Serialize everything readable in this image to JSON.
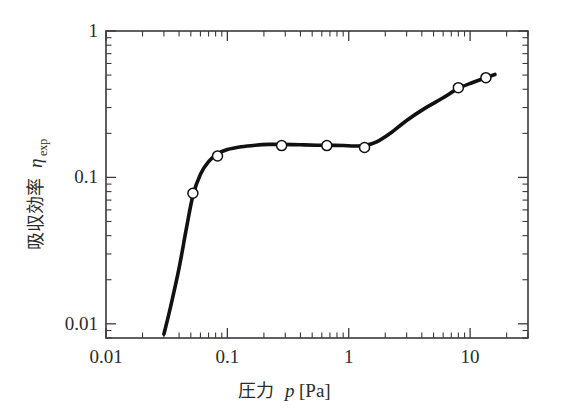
{
  "chart_data": {
    "type": "line",
    "title": "",
    "subtitle": "",
    "xlabel_jp": "圧力",
    "xlabel_sym": "p",
    "xlabel_unit": "[Pa]",
    "xlabel": "圧力 p [Pa]",
    "ylabel_jp": "吸収効率",
    "ylabel_sym": "η",
    "ylabel_subscript": "exp",
    "ylabel": "吸収効率 ηexp",
    "xscale": "log",
    "yscale": "log",
    "xlim": [
      0.01,
      30
    ],
    "ylim": [
      0.008,
      1
    ],
    "xticks": [
      0.01,
      0.1,
      1,
      10
    ],
    "xticklabels": [
      "0.01",
      "0.1",
      "1",
      "10"
    ],
    "yticks": [
      0.01,
      0.1,
      1
    ],
    "yticklabels": [
      "0.01",
      "0.1",
      "1"
    ],
    "grid": false,
    "legend": "none",
    "minor_ticks": true,
    "series": [
      {
        "name": "η_exp",
        "marker": "open-circle",
        "line": "smooth-fit",
        "x": [
          0.052,
          0.083,
          0.28,
          0.66,
          1.35,
          8.0,
          13.5
        ],
        "y": [
          0.078,
          0.14,
          0.165,
          0.165,
          0.16,
          0.41,
          0.48
        ]
      }
    ],
    "fit_curve": {
      "name": "fitted-curve",
      "x": [
        0.03,
        0.034,
        0.04,
        0.046,
        0.052,
        0.06,
        0.07,
        0.083,
        0.1,
        0.13,
        0.17,
        0.22,
        0.28,
        0.4,
        0.55,
        0.66,
        0.9,
        1.1,
        1.35,
        1.7,
        2.2,
        3.0,
        4.2,
        6.0,
        8.0,
        10.5,
        13.5,
        16.0
      ],
      "y": [
        0.0085,
        0.013,
        0.024,
        0.045,
        0.075,
        0.105,
        0.128,
        0.145,
        0.155,
        0.162,
        0.166,
        0.168,
        0.168,
        0.167,
        0.166,
        0.166,
        0.165,
        0.164,
        0.165,
        0.175,
        0.2,
        0.245,
        0.295,
        0.35,
        0.405,
        0.445,
        0.48,
        0.505
      ]
    }
  }
}
